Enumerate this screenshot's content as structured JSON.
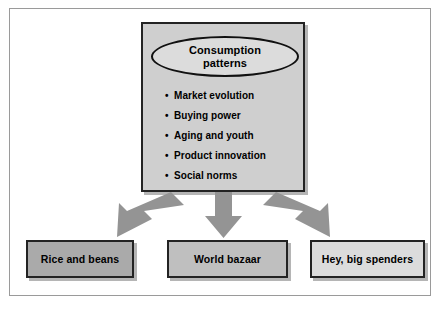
{
  "diagram": {
    "main_node": {
      "ellipse_label": "Consumption\npatterns",
      "ellipse_line1": "Consumption",
      "ellipse_line2": "patterns",
      "bullets": [
        {
          "marker": "•",
          "text": "Market evolution"
        },
        {
          "marker": "•",
          "text": "Buying power"
        },
        {
          "marker": "•",
          "text": "Aging and youth"
        },
        {
          "marker": "•",
          "text": "Product innovation"
        },
        {
          "marker": "•",
          "text": "Social norms"
        }
      ]
    },
    "arrows": [
      {
        "name": "arrow-left",
        "direction": "down-left"
      },
      {
        "name": "arrow-center",
        "direction": "down"
      },
      {
        "name": "arrow-right",
        "direction": "down-right"
      }
    ],
    "outcomes": [
      {
        "label": "Rice and beans",
        "fill": "#aaaaaa"
      },
      {
        "label": "World bazaar",
        "fill": "#bfbfbf"
      },
      {
        "label": "Hey, big spenders",
        "fill": "#dcdcdc"
      }
    ],
    "colors": {
      "main_box_fill": "#cfcfcf",
      "ellipse_fill": "#dcdcdc",
      "arrow_fill": "#949494",
      "border": "#232323",
      "frame": "#9a9a9a",
      "background": "#ffffff"
    }
  }
}
